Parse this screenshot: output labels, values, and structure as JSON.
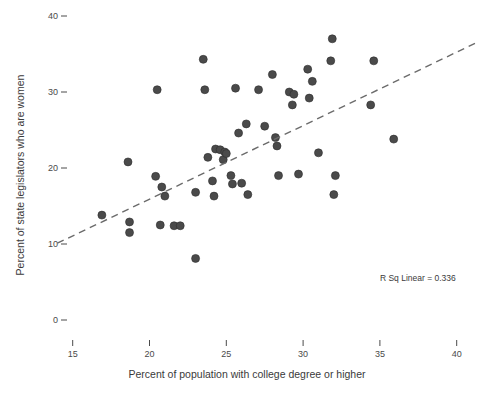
{
  "chart_data": {
    "type": "scatter",
    "title": "",
    "xlabel": "Percent of population with college degree or higher",
    "ylabel": "Percent of state legislators who are women",
    "xlim": [
      13.5,
      41.5
    ],
    "ylim": [
      0,
      42
    ],
    "x_ticks": [
      15,
      20,
      25,
      30,
      35,
      40
    ],
    "y_ticks": [
      0,
      10,
      20,
      30,
      40
    ],
    "grid": false,
    "legend": null,
    "annotations": [
      {
        "name": "r-squared",
        "text": "R Sq Linear = 0.336",
        "x": 35.0,
        "y": 5.1
      }
    ],
    "fit_line": {
      "kind": "linear",
      "style": "dashed",
      "r_squared": 0.336,
      "x_start": 14.0,
      "y_start": 10.1,
      "x_end": 41.4,
      "y_end": 36.6
    },
    "marker": {
      "shape": "circle",
      "size": 4.0,
      "color": "#4a4a4a",
      "edge_color": "#2e2e2e"
    },
    "points": [
      {
        "x": 16.9,
        "y": 13.8
      },
      {
        "x": 18.6,
        "y": 20.8
      },
      {
        "x": 18.7,
        "y": 12.9
      },
      {
        "x": 18.7,
        "y": 11.5
      },
      {
        "x": 20.5,
        "y": 30.3
      },
      {
        "x": 20.4,
        "y": 18.9
      },
      {
        "x": 20.8,
        "y": 17.5
      },
      {
        "x": 21.0,
        "y": 16.3
      },
      {
        "x": 20.7,
        "y": 12.5
      },
      {
        "x": 21.6,
        "y": 12.4
      },
      {
        "x": 22.0,
        "y": 12.4
      },
      {
        "x": 23.0,
        "y": 16.8
      },
      {
        "x": 23.0,
        "y": 8.1
      },
      {
        "x": 23.5,
        "y": 34.3
      },
      {
        "x": 23.6,
        "y": 30.3
      },
      {
        "x": 23.8,
        "y": 21.4
      },
      {
        "x": 24.1,
        "y": 18.3
      },
      {
        "x": 24.2,
        "y": 16.3
      },
      {
        "x": 24.3,
        "y": 22.5
      },
      {
        "x": 24.6,
        "y": 22.4
      },
      {
        "x": 24.8,
        "y": 21.1
      },
      {
        "x": 24.9,
        "y": 22.1
      },
      {
        "x": 25.0,
        "y": 21.9
      },
      {
        "x": 25.3,
        "y": 19.0
      },
      {
        "x": 25.4,
        "y": 17.9
      },
      {
        "x": 25.6,
        "y": 30.5
      },
      {
        "x": 25.8,
        "y": 24.6
      },
      {
        "x": 26.0,
        "y": 18.0
      },
      {
        "x": 26.3,
        "y": 25.8
      },
      {
        "x": 26.4,
        "y": 16.5
      },
      {
        "x": 27.1,
        "y": 30.3
      },
      {
        "x": 27.5,
        "y": 25.5
      },
      {
        "x": 28.0,
        "y": 32.3
      },
      {
        "x": 28.2,
        "y": 24.0
      },
      {
        "x": 28.3,
        "y": 22.9
      },
      {
        "x": 28.4,
        "y": 19.0
      },
      {
        "x": 29.1,
        "y": 30.0
      },
      {
        "x": 29.4,
        "y": 29.7
      },
      {
        "x": 29.3,
        "y": 28.3
      },
      {
        "x": 29.7,
        "y": 19.2
      },
      {
        "x": 30.3,
        "y": 33.0
      },
      {
        "x": 30.6,
        "y": 31.4
      },
      {
        "x": 30.4,
        "y": 29.2
      },
      {
        "x": 31.0,
        "y": 22.0
      },
      {
        "x": 31.9,
        "y": 37.0
      },
      {
        "x": 31.8,
        "y": 34.1
      },
      {
        "x": 32.1,
        "y": 19.0
      },
      {
        "x": 32.0,
        "y": 16.5
      },
      {
        "x": 34.6,
        "y": 34.1
      },
      {
        "x": 34.4,
        "y": 28.3
      },
      {
        "x": 35.9,
        "y": 23.8
      }
    ]
  },
  "axis": {
    "y_tick_labels": [
      "40",
      "30",
      "20",
      "10",
      "0"
    ],
    "x_tick_labels": [
      "15",
      "20",
      "25",
      "30",
      "35",
      "40"
    ],
    "x_title": "Percent of population with college degree or higher",
    "y_title": "Percent of state legislators who are women"
  },
  "annotation": {
    "r_sq_text": "R Sq Linear = 0.336"
  }
}
